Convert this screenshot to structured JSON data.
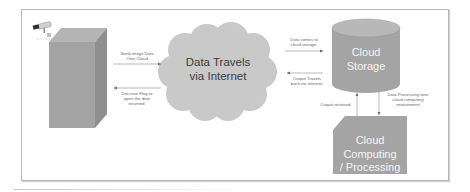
{
  "diagram": {
    "nodes": {
      "building": {
        "label": ""
      },
      "camera": {
        "icon": "security-camera-icon"
      },
      "internet_cloud": {
        "label": "Data Travels\nvia Internet"
      },
      "cloud_storage": {
        "label": "Cloud\nStorage"
      },
      "cloud_computing": {
        "label": "Cloud Computing\n/ Processing"
      }
    },
    "edges": [
      {
        "from": "building",
        "to": "internet_cloud",
        "label": "Send image Data\nOver Cloud"
      },
      {
        "from": "internet_cloud",
        "to": "building",
        "label": "Decision Flag to\nopen the door\nreturned."
      },
      {
        "from": "internet_cloud",
        "to": "cloud_storage",
        "label": "Data comes to\ncloud storage."
      },
      {
        "from": "cloud_storage",
        "to": "internet_cloud",
        "label": "Output Travels\nback via internet."
      },
      {
        "from": "cloud_computing",
        "to": "cloud_storage",
        "label": "Output returned."
      },
      {
        "from": "cloud_storage",
        "to": "cloud_computing",
        "label": "Data Processing over\ncloud computing\nenvironment"
      }
    ],
    "colors": {
      "shape_fill": "#a6a6a6",
      "shape_top": "#b4b4b4",
      "shape_side": "#8f8f8f",
      "cloud_fill": "#c8c8c8",
      "arrow": "#7a7a7a",
      "frame": "#b8b8b8"
    }
  }
}
